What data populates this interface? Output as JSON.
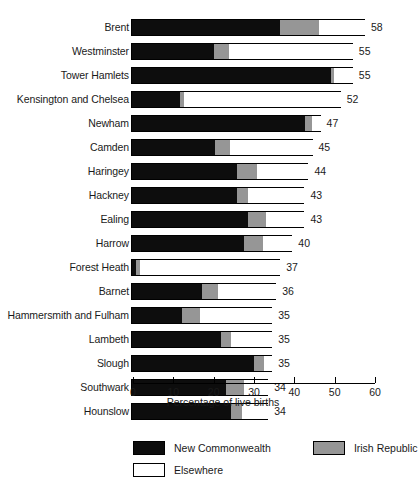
{
  "chart_data": {
    "type": "bar",
    "orientation": "horizontal",
    "stacked": true,
    "title": "",
    "xlabel": "Percentage of live births",
    "ylabel": "",
    "xlim": [
      0,
      60
    ],
    "xticks": [
      0,
      10,
      20,
      30,
      40,
      50,
      60
    ],
    "xtick_labels": [
      "0",
      "10",
      "20",
      "30",
      "40",
      "50",
      "60"
    ],
    "grid": false,
    "legend_position": "bottom",
    "categories": [
      "Brent",
      "Westminster",
      "Tower Hamlets",
      "Kensington and Chelsea",
      "Newham",
      "Camden",
      "Haringey",
      "Hackney",
      "Ealing",
      "Harrow",
      "Forest Heath",
      "Barnet",
      "Hammersmith and Fulham",
      "Lambeth",
      "Slough",
      "Southwark",
      "Hounslow"
    ],
    "series": [
      {
        "name": "New Commonwealth",
        "color": "#0d0d0d",
        "values": [
          36.7,
          20.3,
          49.4,
          12.0,
          42.9,
          20.6,
          26.1,
          26.1,
          28.8,
          27.8,
          1.0,
          17.4,
          12.4,
          22.1,
          30.3,
          23.4,
          24.6
        ]
      },
      {
        "name": "Irish Republic",
        "color": "#969696",
        "values": [
          9.7,
          3.8,
          0.6,
          0.8,
          1.8,
          3.7,
          4.9,
          2.7,
          4.5,
          4.8,
          1.0,
          4.0,
          4.5,
          2.5,
          2.5,
          4.4,
          2.7
        ]
      },
      {
        "name": "Elsewhere",
        "color": "#ffffff",
        "values": [
          11.6,
          30.9,
          5.0,
          39.2,
          2.3,
          20.7,
          13.0,
          14.2,
          9.7,
          7.4,
          35.0,
          14.6,
          18.1,
          10.4,
          2.2,
          6.2,
          6.7
        ]
      }
    ],
    "totals": [
      58,
      55,
      55,
      52,
      47,
      45,
      44,
      43,
      43,
      40,
      37,
      36,
      35,
      35,
      35,
      34,
      34
    ],
    "total_labels": [
      "58",
      "55",
      "55",
      "52",
      "47",
      "45",
      "44",
      "43",
      "43",
      "40",
      "37",
      "36",
      "35",
      "35",
      "35",
      "34",
      "34"
    ]
  },
  "legend": {
    "items": [
      {
        "label": "New Commonwealth",
        "swatch": "nc"
      },
      {
        "label": "Irish Republic",
        "swatch": "ir"
      },
      {
        "label": "Elsewhere",
        "swatch": "el"
      }
    ]
  }
}
